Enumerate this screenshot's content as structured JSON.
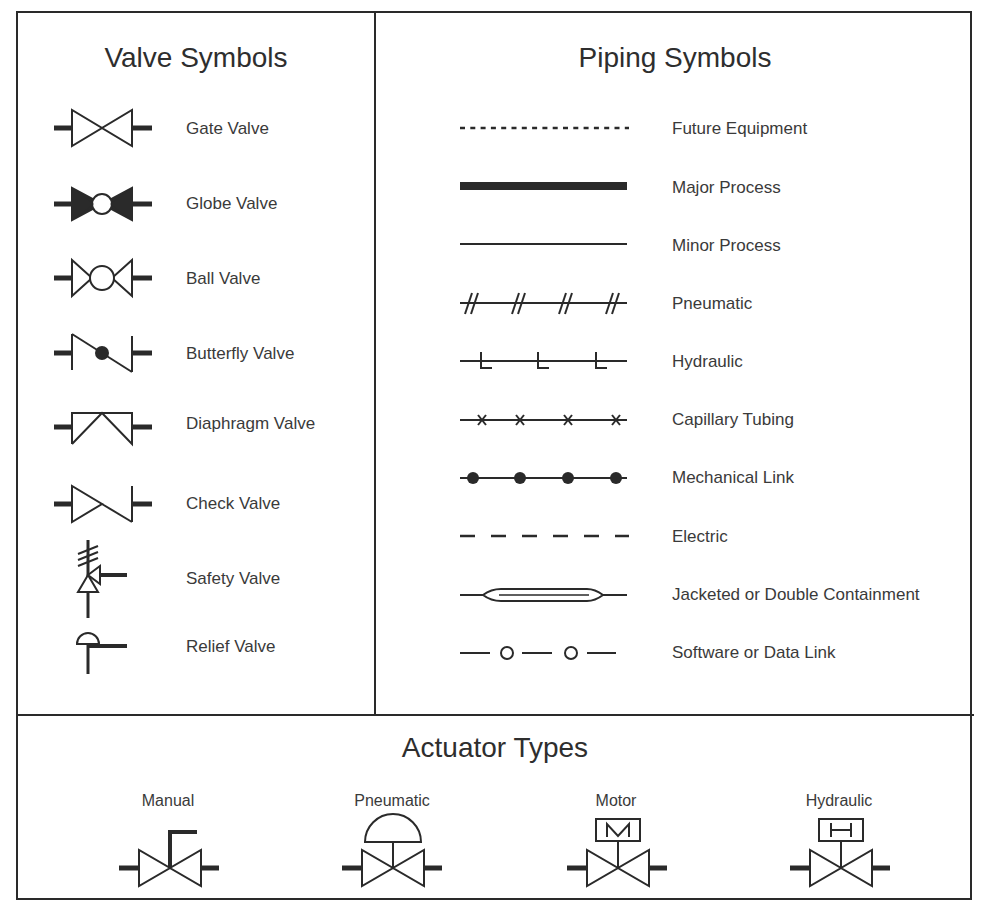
{
  "valve_section": {
    "title": "Valve Symbols",
    "items": [
      {
        "label": "Gate Valve",
        "icon": "gate-valve-icon"
      },
      {
        "label": "Globe Valve",
        "icon": "globe-valve-icon"
      },
      {
        "label": "Ball Valve",
        "icon": "ball-valve-icon"
      },
      {
        "label": "Butterfly Valve",
        "icon": "butterfly-valve-icon"
      },
      {
        "label": "Diaphragm Valve",
        "icon": "diaphragm-valve-icon"
      },
      {
        "label": "Check Valve",
        "icon": "check-valve-icon"
      },
      {
        "label": "Safety Valve",
        "icon": "safety-valve-icon"
      },
      {
        "label": "Relief Valve",
        "icon": "relief-valve-icon"
      }
    ]
  },
  "piping_section": {
    "title": "Piping Symbols",
    "items": [
      {
        "label": "Future Equipment",
        "icon": "dotted-line-icon"
      },
      {
        "label": "Major Process",
        "icon": "thick-line-icon"
      },
      {
        "label": "Minor Process",
        "icon": "thin-line-icon"
      },
      {
        "label": "Pneumatic",
        "icon": "double-hash-line-icon"
      },
      {
        "label": "Hydraulic",
        "icon": "l-tick-line-icon"
      },
      {
        "label": "Capillary Tubing",
        "icon": "x-mark-line-icon"
      },
      {
        "label": "Mechanical Link",
        "icon": "dot-line-icon"
      },
      {
        "label": "Electric",
        "icon": "dashed-line-icon"
      },
      {
        "label": "Jacketed or Double Containment",
        "icon": "jacketed-line-icon"
      },
      {
        "label": "Software or Data Link",
        "icon": "circle-link-line-icon"
      }
    ]
  },
  "actuator_section": {
    "title": "Actuator Types",
    "items": [
      {
        "label": "Manual",
        "icon": "manual-actuator-icon"
      },
      {
        "label": "Pneumatic",
        "icon": "pneumatic-actuator-icon"
      },
      {
        "label": "Motor",
        "icon": "motor-actuator-icon",
        "glyph": "M"
      },
      {
        "label": "Hydraulic",
        "icon": "hydraulic-actuator-icon",
        "glyph": "H"
      }
    ]
  },
  "colors": {
    "stroke": "#2a2a2a",
    "text": "#3a3a3a",
    "background": "#ffffff"
  }
}
